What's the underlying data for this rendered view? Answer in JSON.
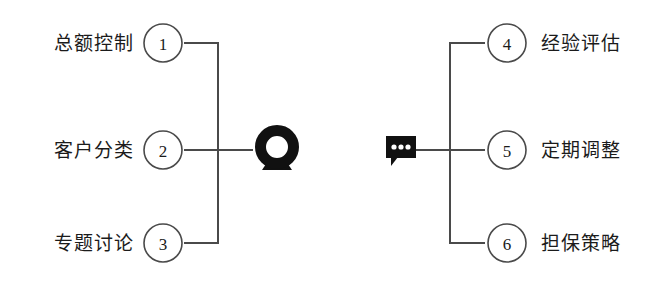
{
  "diagram": {
    "type": "mirrored-bracket-diagram",
    "background_color": "#ffffff",
    "stroke_color": "#4a4a4a",
    "icon_color": "#111111",
    "text_color": "#1b1b1b",
    "groups": [
      {
        "side": "left",
        "icon": {
          "name": "webcam-icon",
          "shape": "thick-ring-on-stand"
        },
        "nodes": [
          {
            "number": "1",
            "label": "总额控制"
          },
          {
            "number": "2",
            "label": "客户分类"
          },
          {
            "number": "3",
            "label": "专题讨论"
          }
        ]
      },
      {
        "side": "right",
        "icon": {
          "name": "speech-bubble-ellipsis-icon",
          "shape": "filled-rectangle-bubble-three-dots"
        },
        "nodes": [
          {
            "number": "4",
            "label": "经验评估"
          },
          {
            "number": "5",
            "label": "定期调整"
          },
          {
            "number": "6",
            "label": "担保策略"
          }
        ]
      }
    ]
  }
}
